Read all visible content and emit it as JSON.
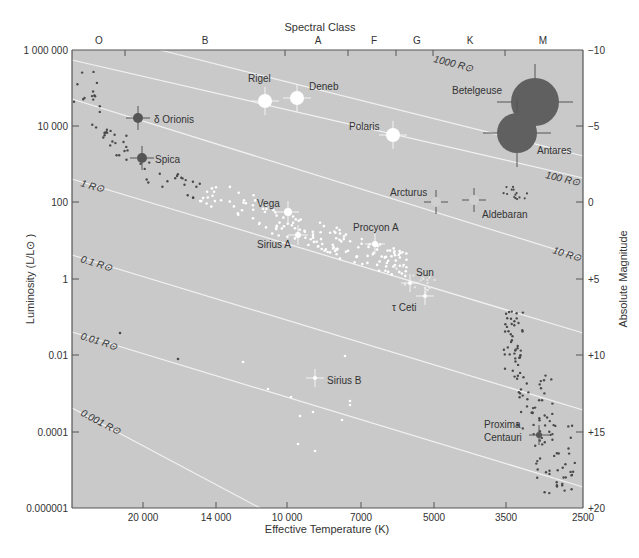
{
  "chart_data": {
    "type": "scatter",
    "top_axis_label": "Spectral Class",
    "xlabel": "Effective Temperature (K)",
    "ylabel": "Luminosity (L/L⊙ )",
    "y2label": "Absolute Magnitude",
    "x_scale": "log (reversed)",
    "y_scale": "log",
    "spectral_classes": [
      {
        "label": "O",
        "x": 99
      },
      {
        "label": "B",
        "x": 205
      },
      {
        "label": "A",
        "x": 318
      },
      {
        "label": "F",
        "x": 374
      },
      {
        "label": "G",
        "x": 417
      },
      {
        "label": "K",
        "x": 470
      },
      {
        "label": "M",
        "x": 543
      }
    ],
    "spectral_ticks_x": [
      125,
      285,
      348,
      396,
      433,
      505
    ],
    "x_ticks": [
      {
        "label": "20 000",
        "x": 143
      },
      {
        "label": "14 000",
        "x": 216
      },
      {
        "label": "10 000",
        "x": 287
      },
      {
        "label": "7000",
        "x": 361
      },
      {
        "label": "5000",
        "x": 434
      },
      {
        "label": "3500",
        "x": 506
      },
      {
        "label": "2500",
        "x": 583
      }
    ],
    "y_ticks": [
      {
        "label": "1 000 000",
        "y": 50
      },
      {
        "label": "10 000",
        "y": 126
      },
      {
        "label": "100",
        "y": 202
      },
      {
        "label": "1",
        "y": 279
      },
      {
        "label": "0.01",
        "y": 355
      },
      {
        "label": "0.0001",
        "y": 432
      },
      {
        "label": "0.000001",
        "y": 508
      }
    ],
    "y2_ticks": [
      {
        "label": "−10",
        "y": 50
      },
      {
        "label": "−5",
        "y": 126
      },
      {
        "label": "0",
        "y": 202
      },
      {
        "label": "+5",
        "y": 279
      },
      {
        "label": "+10",
        "y": 355
      },
      {
        "label": "+15",
        "y": 432
      },
      {
        "label": "+20",
        "y": 508
      }
    ],
    "radius_lines": [
      {
        "label": "1000 R⊙",
        "lx": 433,
        "ly": 62,
        "x1": 160,
        "y1": 50,
        "x2": 583,
        "y2": 156
      },
      {
        "label": "100 R⊙",
        "lx": 545,
        "ly": 178,
        "x1": 72,
        "y1": 60,
        "x2": 583,
        "y2": 178
      },
      {
        "label": "10 R⊙",
        "lx": 552,
        "ly": 253,
        "x1": 72,
        "y1": 99,
        "x2": 583,
        "y2": 258
      },
      {
        "label": "1 R⊙",
        "lx": 80,
        "ly": 186,
        "x1": 72,
        "y1": 179,
        "x2": 583,
        "y2": 333
      },
      {
        "label": "0.1 R⊙",
        "lx": 80,
        "ly": 262,
        "x1": 72,
        "y1": 255,
        "x2": 583,
        "y2": 410
      },
      {
        "label": "0.01 R⊙",
        "lx": 80,
        "ly": 339,
        "x1": 72,
        "y1": 332,
        "x2": 583,
        "y2": 487
      },
      {
        "label": "0.001 R⊙",
        "lx": 80,
        "ly": 415,
        "x1": 72,
        "y1": 408,
        "x2": 260,
        "y2": 508
      }
    ],
    "named_stars": [
      {
        "name": "Betelgeuse",
        "cx": 535,
        "cy": 102,
        "r": 24,
        "color": "#606060",
        "lx": 452,
        "ly": 94
      },
      {
        "name": "Antares",
        "cx": 517,
        "cy": 133,
        "r": 20,
        "color": "#606060",
        "lx": 537,
        "ly": 154
      },
      {
        "name": "Rigel",
        "cx": 265,
        "cy": 101,
        "r": 7,
        "color": "#ffffff",
        "lx": 248,
        "ly": 82
      },
      {
        "name": "Deneb",
        "cx": 297,
        "cy": 98,
        "r": 7,
        "color": "#ffffff",
        "lx": 309,
        "ly": 90
      },
      {
        "name": "Polaris",
        "cx": 393,
        "cy": 135,
        "r": 7,
        "color": "#ffffff",
        "lx": 349,
        "ly": 130
      },
      {
        "name": "δ Orionis",
        "cx": 138,
        "cy": 118,
        "r": 5,
        "color": "#555555",
        "lx": 154,
        "ly": 123
      },
      {
        "name": "Spica",
        "cx": 142,
        "cy": 158,
        "r": 5,
        "color": "#555555",
        "lx": 155,
        "ly": 163
      },
      {
        "name": "Vega",
        "cx": 288,
        "cy": 212,
        "r": 4,
        "color": "#ffffff",
        "lx": 257,
        "ly": 207
      },
      {
        "name": "Sirius A",
        "cx": 298,
        "cy": 235,
        "r": 3,
        "color": "#ffffff",
        "lx": 257,
        "ly": 248
      },
      {
        "name": "Procyon A",
        "cx": 375,
        "cy": 244,
        "r": 3,
        "color": "#ffffff",
        "lx": 353,
        "ly": 231
      },
      {
        "name": "Arcturus",
        "cx": 436,
        "cy": 202,
        "r": 5,
        "color": "#d0d0d0",
        "lx": 390,
        "ly": 196
      },
      {
        "name": "Aldebaran",
        "cx": 474,
        "cy": 200,
        "r": 5,
        "color": "#d0d0d0",
        "lx": 482,
        "ly": 218
      },
      {
        "name": "Sun",
        "cx": 410,
        "cy": 283,
        "r": 2,
        "color": "#ffffff",
        "lx": 416,
        "ly": 276
      },
      {
        "name": "τ Ceti",
        "cx": 425,
        "cy": 296,
        "r": 2,
        "color": "#ffffff",
        "lx": 392,
        "ly": 311
      },
      {
        "name": "Sirius B",
        "cx": 315,
        "cy": 378,
        "r": 2,
        "color": "#ffffff",
        "lx": 327,
        "ly": 384
      },
      {
        "name": "Proxima",
        "cx": 539,
        "cy": 435,
        "r": 3,
        "color": "#555555",
        "lx": 484,
        "ly": 428
      },
      {
        "name": "Centauri",
        "cx": 539,
        "cy": 435,
        "r": 0,
        "color": "#555555",
        "lx": 484,
        "ly": 441
      }
    ],
    "colors": {
      "plot_bg": "#c9c9c9",
      "frame": "#555555",
      "radius_line": "#f2f2f2",
      "dark_star": "#4a4a4a",
      "light_star": "#ffffff",
      "text": "#333333"
    },
    "grid": false,
    "legend": "none"
  }
}
